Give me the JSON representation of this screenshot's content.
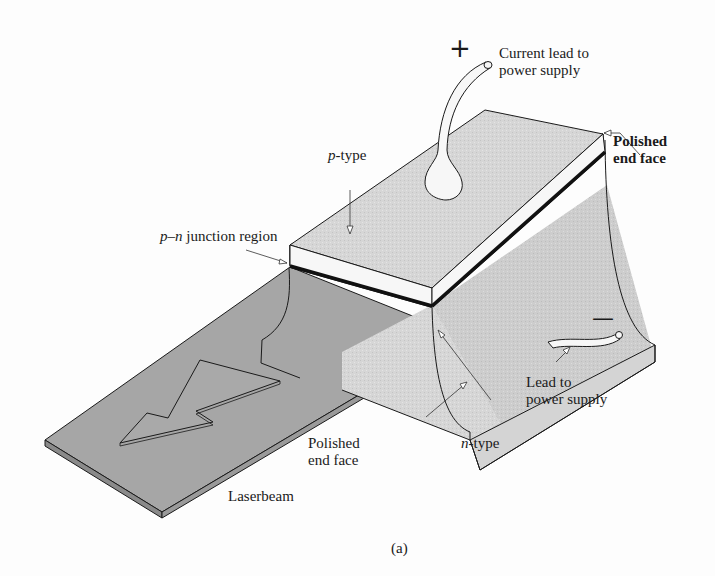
{
  "figure": {
    "caption": "(a)",
    "colors": {
      "background": "#fdfdfd",
      "block_top": "#d9d9d9",
      "block_side": "#cfcfcf",
      "junction_stripe": "#f7f7f7",
      "laser_beam": "#a6a6a6",
      "outline": "#1a1a1a"
    },
    "labels": {
      "plus_sign": "+",
      "minus_sign": "—",
      "current_lead_line1": "Current lead to",
      "current_lead_line2": "power supply",
      "p_type_prefix": "p",
      "p_type_suffix": "-type",
      "polished_top_line1": "Polished",
      "polished_top_line2": "end face",
      "pn_junction_p": "p",
      "pn_junction_dash": "–",
      "pn_junction_n": "n",
      "pn_junction_rest": " junction region",
      "lead_line1": "Lead to",
      "lead_line2": "power supply",
      "n_type_prefix": "n",
      "n_type_suffix": "-type",
      "polished_bottom_line1": "Polished",
      "polished_bottom_line2": "end face",
      "laserbeam": "Laserbeam"
    }
  }
}
